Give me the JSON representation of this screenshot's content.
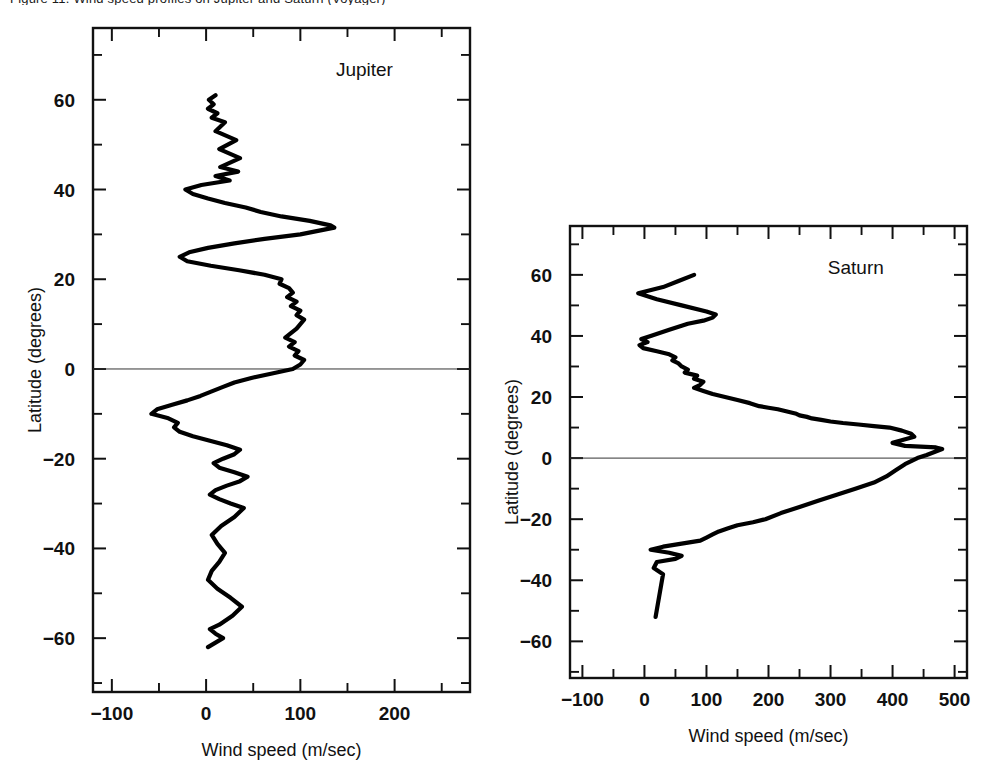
{
  "figure": {
    "partial_caption_top": "Figure 11.   Wind speed profiles on Jupiter and Saturn (Voyager)"
  },
  "chart_data": [
    {
      "type": "line",
      "title": "Jupiter",
      "xlabel": "Wind speed (m/sec)",
      "ylabel": "Latitude (degrees)",
      "xlim": [
        -120,
        280
      ],
      "ylim": [
        -72,
        76
      ],
      "xticks": [
        -100,
        0,
        100,
        200
      ],
      "xticklabels": [
        "−100",
        "0",
        "100",
        "200"
      ],
      "yticks": [
        -60,
        -40,
        -20,
        0,
        20,
        40,
        60
      ],
      "yticklabels": [
        "−60",
        "−40",
        "−20",
        "0",
        "20",
        "40",
        "60"
      ],
      "xtick_minor_step": 50,
      "ytick_minor_step": 10,
      "grid": false,
      "zero_latitude_line": true,
      "series": [
        {
          "name": "Jupiter zonal wind",
          "x": [
            10,
            3,
            8,
            2,
            12,
            6,
            20,
            10,
            32,
            14,
            36,
            15,
            34,
            10,
            25,
            -5,
            -22,
            -14,
            2,
            20,
            42,
            58,
            80,
            110,
            132,
            136,
            100,
            62,
            30,
            2,
            -18,
            -28,
            -20,
            5,
            35,
            62,
            80,
            78,
            88,
            92,
            86,
            96,
            90,
            100,
            96,
            104,
            100,
            96,
            90,
            84,
            94,
            88,
            98,
            94,
            104,
            100,
            92,
            70,
            48,
            30,
            18,
            6,
            -6,
            -20,
            -36,
            -52,
            -58,
            -40,
            -30,
            -34,
            -28,
            -14,
            4,
            22,
            36,
            30,
            18,
            8,
            14,
            30,
            44,
            36,
            22,
            10,
            4,
            14,
            26,
            40,
            30,
            16,
            6,
            12,
            20,
            14,
            6,
            2,
            12,
            26,
            38,
            28,
            14,
            4,
            10,
            18,
            10,
            2
          ],
          "y": [
            61,
            60,
            59,
            58,
            57,
            56,
            55,
            53,
            51,
            49,
            47,
            45,
            44,
            43,
            42,
            41,
            40,
            39,
            38,
            37,
            36,
            35,
            34,
            33,
            32,
            31.5,
            30,
            29,
            28,
            27,
            26,
            25,
            24,
            23,
            22,
            21,
            20,
            19,
            18,
            17,
            16,
            15,
            14,
            13,
            12,
            11,
            10,
            9,
            8,
            7,
            6,
            5,
            4,
            3,
            2,
            1,
            0,
            -1,
            -2,
            -3,
            -4,
            -5,
            -6,
            -7,
            -8,
            -9,
            -10,
            -11,
            -12,
            -13,
            -14,
            -15,
            -16,
            -17,
            -18,
            -19,
            -20,
            -21,
            -22,
            -23,
            -24,
            -25,
            -26,
            -27,
            -28,
            -29,
            -30,
            -31,
            -33,
            -35,
            -37,
            -39,
            -41,
            -43,
            -45,
            -47,
            -49,
            -51,
            -53,
            -55,
            -57,
            -58,
            -59,
            -60,
            -61,
            -62
          ]
        }
      ]
    },
    {
      "type": "line",
      "title": "Saturn",
      "xlabel": "Wind speed (m/sec)",
      "ylabel": "Latitude (degrees)",
      "xlim": [
        -120,
        520
      ],
      "ylim": [
        -72,
        76
      ],
      "xticks": [
        -100,
        0,
        100,
        200,
        300,
        400,
        500
      ],
      "xticklabels": [
        "−100",
        "0",
        "100",
        "200",
        "300",
        "400",
        "500"
      ],
      "yticks": [
        -60,
        -40,
        -20,
        0,
        20,
        40,
        60
      ],
      "yticklabels": [
        "−60",
        "−40",
        "−20",
        "0",
        "20",
        "40",
        "60"
      ],
      "xtick_minor_step": 50,
      "ytick_minor_step": 10,
      "grid": false,
      "zero_latitude_line": true,
      "series": [
        {
          "name": "Saturn zonal wind",
          "x": [
            80,
            55,
            30,
            -10,
            20,
            60,
            100,
            115,
            110,
            95,
            70,
            40,
            10,
            -5,
            5,
            -8,
            -2,
            20,
            40,
            50,
            45,
            55,
            60,
            70,
            65,
            85,
            80,
            95,
            90,
            80,
            95,
            110,
            130,
            150,
            170,
            185,
            200,
            215,
            225,
            235,
            245,
            250,
            262,
            270,
            285,
            300,
            320,
            345,
            370,
            395,
            415,
            430,
            435,
            400,
            420,
            470,
            480,
            455,
            440,
            420,
            405,
            390,
            370,
            340,
            310,
            280,
            250,
            220,
            195,
            175,
            150,
            135,
            120,
            110,
            100,
            90,
            60,
            30,
            10,
            40,
            60,
            50,
            20,
            15,
            30,
            18
          ],
          "y": [
            60,
            58,
            56,
            54,
            52,
            50,
            48,
            47,
            46,
            45,
            44,
            42,
            40,
            39,
            38,
            37,
            36,
            35,
            34,
            33,
            32,
            31,
            30,
            29,
            28,
            27,
            26,
            25,
            24,
            23,
            22,
            21,
            20,
            19,
            18,
            17,
            16.5,
            16,
            15.5,
            15,
            14.5,
            14,
            13.5,
            13,
            12.5,
            12,
            11.5,
            11,
            10.5,
            10,
            9,
            8,
            7,
            5,
            4,
            3.5,
            3,
            1,
            0,
            -2,
            -4,
            -6,
            -8,
            -10,
            -12,
            -14,
            -16,
            -18,
            -20,
            -21,
            -22,
            -23,
            -24,
            -25,
            -26,
            -27,
            -28,
            -29,
            -30,
            -31,
            -32,
            -33,
            -34,
            -36,
            -38,
            -52
          ]
        }
      ]
    }
  ]
}
